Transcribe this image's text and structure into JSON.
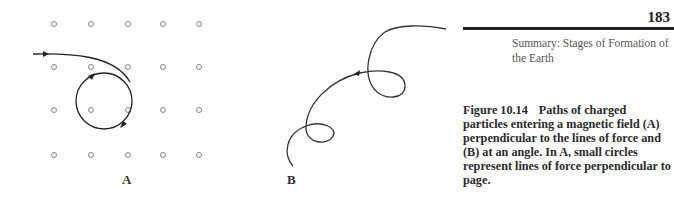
{
  "page": {
    "number": "183",
    "running_head": "Summary: Stages of Formation of the Earth"
  },
  "figure": {
    "number": "Figure 10.14",
    "caption": "Paths of charged particles entering a magnetic field (A) perpendicular to the lines of force and (B) at an angle. In A, small circles represent lines of force perpendicular to page.",
    "panels": [
      {
        "label": "A",
        "description": "Grid of small circles (lines of force perpendicular to page); particle path curves into a circular orbit"
      },
      {
        "label": "B",
        "description": "Helical/spiral particle path entering field at an angle"
      }
    ],
    "panel_a_grid": {
      "columns": 5,
      "rows": 4
    }
  }
}
